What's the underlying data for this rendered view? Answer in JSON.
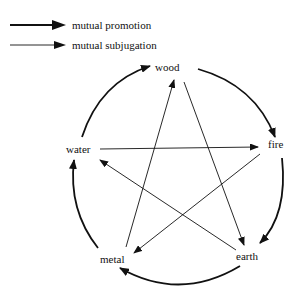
{
  "legend": [
    {
      "label": "mutual promotion",
      "style": "thick"
    },
    {
      "label": "mutual subjugation",
      "style": "thin"
    }
  ],
  "nodes": {
    "wood": "wood",
    "fire": "fire",
    "earth": "earth",
    "metal": "metal",
    "water": "water"
  },
  "colors": {
    "line": "#111111",
    "background": "#ffffff"
  }
}
